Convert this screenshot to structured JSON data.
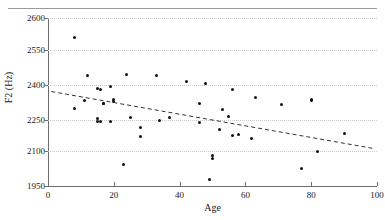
{
  "figure": {
    "clipped_caption_above": "",
    "xlabel": "Age",
    "ylabel": "F2 (Hz)"
  },
  "axes": {
    "y_ticks": [
      "2600",
      "2550",
      "2400",
      "2250",
      "2100",
      "1950"
    ],
    "x_ticks": [
      "0",
      "20",
      "40",
      "60",
      "80",
      "100"
    ]
  },
  "chart_data": {
    "type": "scatter",
    "title": "",
    "xlabel": "Age",
    "ylabel": "F2 (Hz)",
    "xlim": [
      0,
      100
    ],
    "ylim": [
      1950,
      2600
    ],
    "grid": true,
    "legend": "none",
    "x_tick_values": [
      0,
      20,
      40,
      60,
      80,
      100
    ],
    "y_tick_values": [
      2600,
      2550,
      2400,
      2250,
      2100,
      1950
    ],
    "point_color": "#111111",
    "trendline_color": "#333333",
    "trendline_style": "dashed",
    "series": [
      {
        "name": "speakers",
        "points": [
          [
            8,
            2570
          ],
          [
            8,
            2300
          ],
          [
            11,
            2332
          ],
          [
            12,
            2440
          ],
          [
            15,
            2383
          ],
          [
            15,
            2255
          ],
          [
            15,
            2244
          ],
          [
            16,
            2380
          ],
          [
            16,
            2241
          ],
          [
            17,
            2322
          ],
          [
            17,
            2319
          ],
          [
            19,
            2392
          ],
          [
            19,
            2243
          ],
          [
            20,
            2337
          ],
          [
            20,
            2330
          ],
          [
            23,
            2043
          ],
          [
            24,
            2446
          ],
          [
            25,
            2260
          ],
          [
            28,
            2214
          ],
          [
            28,
            2170
          ],
          [
            33,
            2441
          ],
          [
            34,
            2247
          ],
          [
            37,
            2260
          ],
          [
            42,
            2413
          ],
          [
            46,
            2321
          ],
          [
            46,
            2237
          ],
          [
            48,
            2408
          ],
          [
            49,
            1978
          ],
          [
            50,
            2082
          ],
          [
            50,
            2070
          ],
          [
            52,
            2203
          ],
          [
            53,
            2296
          ],
          [
            55,
            2266
          ],
          [
            56,
            2382
          ],
          [
            56,
            2177
          ],
          [
            58,
            2178
          ],
          [
            62,
            2161
          ],
          [
            63,
            2348
          ],
          [
            71,
            2318
          ],
          [
            77,
            2024
          ],
          [
            80,
            2340
          ],
          [
            80,
            2332
          ],
          [
            82,
            2100
          ],
          [
            90,
            2186
          ]
        ]
      }
    ],
    "trendline": {
      "x_start": 1,
      "y_start": 2372,
      "x_end": 99,
      "y_end": 2112
    }
  }
}
